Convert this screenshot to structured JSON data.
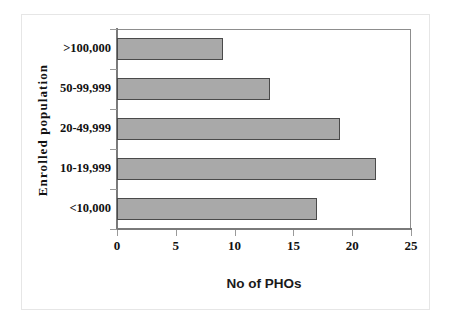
{
  "chart_data": {
    "type": "bar",
    "orientation": "horizontal",
    "title": "",
    "xlabel": "No of PHOs",
    "ylabel": "Enrolled population",
    "categories": [
      "<10,000",
      "10-19,999",
      "20-49,999",
      "50-99,999",
      ">100,000"
    ],
    "values": [
      17,
      22,
      19,
      13,
      9
    ],
    "xlim": [
      0,
      25
    ],
    "xticks": [
      "0",
      "5",
      "10",
      "15",
      "20",
      "25"
    ],
    "grid": false,
    "legend": false,
    "series": [
      {
        "name": "No of PHOs",
        "values": [
          17,
          22,
          19,
          13,
          9
        ]
      }
    ],
    "bar_fill_color": "#a9a9a9",
    "bar_border_color": "#4a4a4a",
    "axis_color": "#7a7a7a",
    "background_color": "#ffffff"
  }
}
